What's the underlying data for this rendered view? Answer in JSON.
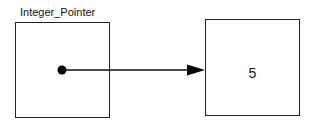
{
  "diagram": {
    "pointer_variable": {
      "name": "Integer_Pointer"
    },
    "target_cell": {
      "value": "5"
    },
    "arrow": {
      "from": "pointer_variable",
      "to": "target_cell"
    }
  }
}
